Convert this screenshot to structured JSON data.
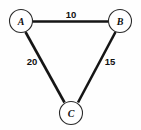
{
  "figure": {
    "type": "weighted-undirected-graph",
    "background_color": "#fefefe",
    "edge_color": "#151515",
    "node_fill_color": "#ffffff",
    "node_stroke_color": "#2a2a2a",
    "label_color": "#101010"
  },
  "nodes": [
    {
      "id": "A",
      "label": "A",
      "cx": 21,
      "cy": 21,
      "r": 11.5
    },
    {
      "id": "B",
      "label": "B",
      "cx": 120,
      "cy": 21,
      "r": 11.5
    },
    {
      "id": "C",
      "label": "C",
      "cx": 71,
      "cy": 113,
      "r": 11.5
    }
  ],
  "edges": [
    {
      "id": "AB",
      "from": "A",
      "to": "B",
      "weight": "10",
      "x1": 32.5,
      "y1": 21.5,
      "x2": 108.5,
      "y2": 21.5,
      "weight_x": 71,
      "weight_y": 14
    },
    {
      "id": "AC",
      "from": "A",
      "to": "C",
      "weight": "20",
      "x1": 25.5,
      "y1": 32,
      "x2": 64.5,
      "y2": 102.5,
      "weight_x": 32,
      "weight_y": 61
    },
    {
      "id": "BC",
      "from": "B",
      "to": "C",
      "weight": "15",
      "x1": 115.5,
      "y1": 32,
      "x2": 78,
      "y2": 102.5,
      "weight_x": 110,
      "weight_y": 61
    }
  ],
  "chart_data": {
    "type": "graph",
    "title": "",
    "nodes": [
      "A",
      "B",
      "C"
    ],
    "edges": [
      {
        "source": "A",
        "target": "B",
        "weight": 10
      },
      {
        "source": "A",
        "target": "C",
        "weight": 20
      },
      {
        "source": "B",
        "target": "C",
        "weight": 15
      }
    ],
    "directed": false,
    "weighted": true
  }
}
